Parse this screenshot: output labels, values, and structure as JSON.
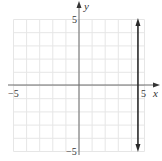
{
  "chart_data": {
    "type": "line",
    "title": "",
    "xlabel": "x",
    "ylabel": "y",
    "xlim": [
      -5,
      5
    ],
    "ylim": [
      -5,
      5
    ],
    "grid": true,
    "x_tick_labels": [
      "-5",
      "5"
    ],
    "y_tick_labels": [
      "5",
      "-5"
    ],
    "series": [
      {
        "name": "vertical line",
        "description": "vertical line x = 4.5 with arrows at both ends",
        "x": [
          4.5,
          4.5
        ],
        "y": [
          -5,
          5
        ]
      }
    ]
  },
  "labels": {
    "x_axis": "x",
    "y_axis": "y",
    "x_neg": "−5",
    "x_pos": "5",
    "y_pos": "5",
    "y_neg": "−5"
  },
  "colors": {
    "grid": "#e6e6e6",
    "axis": "#6a6a6a",
    "line": "#2a2a2a",
    "text": "#333333"
  }
}
